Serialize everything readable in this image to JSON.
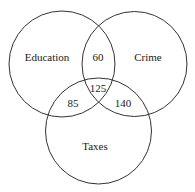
{
  "diagram": {
    "type": "venn",
    "sets": [
      {
        "name": "Education",
        "cx": 62,
        "cy": 64,
        "r": 53
      },
      {
        "name": "Crime",
        "cx": 134.5,
        "cy": 64,
        "r": 52.5
      },
      {
        "name": "Taxes",
        "cx": 98.5,
        "cy": 131,
        "r": 53
      }
    ],
    "regions": {
      "education_crime": "60",
      "all_three": "125",
      "education_taxes": "85",
      "crime_taxes": "140"
    },
    "labels": {
      "education": "Education",
      "crime": "Crime",
      "taxes": "Taxes"
    },
    "stroke_color": "#333333"
  }
}
